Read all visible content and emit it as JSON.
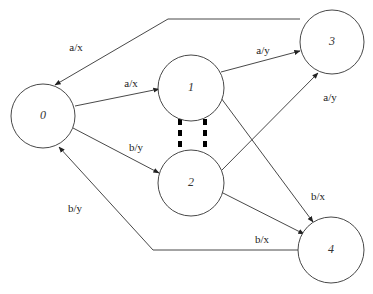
{
  "diagram": {
    "type": "state-machine",
    "colors": {
      "stroke": "#333333",
      "background": "#ffffff",
      "dashed": "#000000"
    },
    "nodes": [
      {
        "id": "0",
        "label": "0",
        "cx": 43,
        "cy": 116,
        "r": 32
      },
      {
        "id": "1",
        "label": "1",
        "cx": 191,
        "cy": 88,
        "r": 33
      },
      {
        "id": "2",
        "label": "2",
        "cx": 191,
        "cy": 183,
        "r": 33
      },
      {
        "id": "3",
        "label": "3",
        "cx": 332,
        "cy": 42,
        "r": 32
      },
      {
        "id": "4",
        "label": "4",
        "cx": 331,
        "cy": 250,
        "r": 33
      }
    ],
    "edges": [
      {
        "from": "0",
        "to": "1",
        "label": "a/x",
        "points": "75,106 159,89",
        "label_x": 131,
        "label_y": 84
      },
      {
        "from": "0",
        "to": "2",
        "label": "b/y",
        "points": "73,128 159,173",
        "label_x": 136,
        "label_y": 148
      },
      {
        "from": "1",
        "to": "3",
        "label": "a/y",
        "points": "221,72 300,51",
        "label_x": 263,
        "label_y": 51
      },
      {
        "from": "2",
        "to": "3",
        "label": "a/y",
        "points": "221,171 318,73",
        "label_x": 330,
        "label_y": 98
      },
      {
        "from": "1",
        "to": "4",
        "label": "b/x",
        "points": "221,98 313,222",
        "label_x": 318,
        "label_y": 197
      },
      {
        "from": "2",
        "to": "4",
        "label": "b/x",
        "points": "221,192 304,234",
        "label_x": 262,
        "label_y": 240
      },
      {
        "from": "3",
        "to": "0",
        "label": "a/x",
        "points": "300,19 168,19 55,85",
        "label_x": 76,
        "label_y": 48
      },
      {
        "from": "4",
        "to": "0",
        "label": "b/y",
        "points": "298,250 153,250 59,147",
        "label_x": 75,
        "label_y": 209
      }
    ],
    "link_1_2": {
      "style": "thick-dashed-pair",
      "x1": 180,
      "x2": 205,
      "y_top": 119,
      "y_bottom": 150
    }
  }
}
